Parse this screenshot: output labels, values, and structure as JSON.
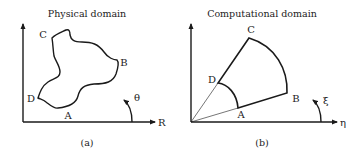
{
  "panels": [
    {
      "id": "a",
      "title": "Physical domain",
      "caption": "(a)",
      "points": {
        "A": "A",
        "B": "B",
        "C": "C",
        "D": "D"
      },
      "axis_label": "R",
      "angle_label": "θ"
    },
    {
      "id": "b",
      "title": "Computational domain",
      "caption": "(b)",
      "points": {
        "A": "A",
        "B": "B",
        "C": "C",
        "D": "D"
      },
      "axis_label": "η",
      "angle_label": "ξ"
    }
  ],
  "colors": {
    "stroke": "#1a1a1a",
    "text": "#222222",
    "background": "#ffffff"
  }
}
